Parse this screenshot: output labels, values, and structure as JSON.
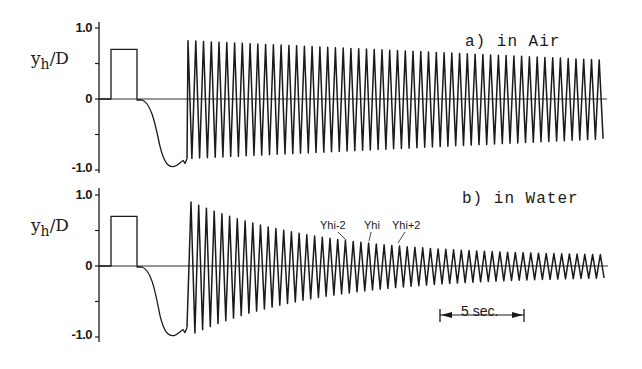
{
  "chart_data": [
    {
      "type": "line",
      "title": "a) in Air",
      "ylabel": "y_h/D",
      "ylabel_main": "y",
      "ylabel_sub": "h",
      "ylabel_tail": "/D",
      "xlabel": "",
      "ylim": [
        -1.0,
        1.0
      ],
      "yticks": [
        "1.0",
        "0",
        "-1.0"
      ],
      "time_scale_bar": "5 sec.",
      "grid": false,
      "description": "Hold at 0, step pulse to ~0.7, release, slow drift to ~-0.95, then sustained oscillation with amplitude ~0.8 slowly decaying to ~0.55",
      "segments": {
        "pulse_level": 0.7,
        "drift_min": -0.95,
        "osc_start_amplitude": 0.82,
        "osc_end_amplitude": 0.55,
        "osc_cycles": 54
      }
    },
    {
      "type": "line",
      "title": "b) in Water",
      "ylabel": "y_h/D",
      "ylabel_main": "y",
      "ylabel_sub": "h",
      "ylabel_tail": "/D",
      "xlabel": "",
      "ylim": [
        -1.0,
        1.0
      ],
      "yticks": [
        "1.0",
        "0",
        "-1.0"
      ],
      "annotations": [
        "Yhi-2",
        "Yhi",
        "Yhi+2"
      ],
      "time_scale_bar": "5 sec.",
      "grid": false,
      "description": "Hold at 0, step pulse to ~0.7, release, slow drift to ~-0.98, then damped oscillation decaying from ~0.9 to ~0.13",
      "segments": {
        "pulse_level": 0.7,
        "drift_min": -0.98,
        "osc_start_amplitude": 0.9,
        "osc_end_amplitude": 0.13,
        "osc_cycles": 54
      }
    }
  ],
  "panels": {
    "air": {
      "title": "a) in Air",
      "tick_top": "1.0",
      "tick_mid": "0",
      "tick_bot": "-1.0"
    },
    "water": {
      "title": "b) in Water",
      "tick_top": "1.0",
      "tick_mid": "0",
      "tick_bot": "-1.0"
    }
  },
  "ylabel": {
    "main": "y",
    "sub": "h",
    "tail": "/D"
  },
  "annotations": {
    "a1": "Yhi-2",
    "a2": "Yhi",
    "a3": "Yhi+2"
  },
  "scale_bar": {
    "label": "5 sec."
  }
}
